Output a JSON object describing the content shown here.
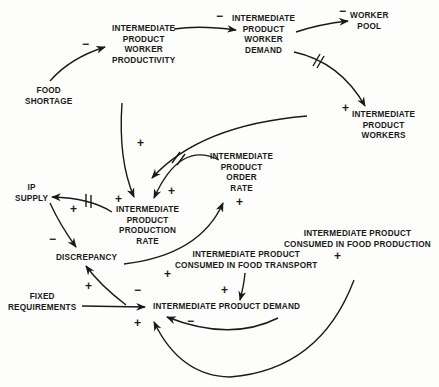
{
  "diagram": {
    "type": "causal-loop-diagram",
    "nodes": {
      "ip_worker_productivity": "INTERMEDIATE\nPRODUCT\nWORKER\nPRODUCTIVITY",
      "ip_worker_demand": "INTERMEDIATE\nPRODUCT\nWORKER\nDEMAND",
      "worker_pool": "WORKER\nPOOL",
      "food_shortage": "FOOD\nSHORTAGE",
      "ip_workers": "INTERMEDIATE\nPRODUCT\nWORKERS",
      "ip_order_rate": "INTERMEDIATE\nPRODUCT\nORDER\nRATE",
      "ip_supply": "IP\nSUPPLY",
      "ip_production_rate": "INTERMEDIATE\nPRODUCT\nPRODUCTION\nRATE",
      "discrepancy": "DISCREPANCY",
      "ip_consumed_food_production": "INTERMEDIATE PRODUCT\nCONSUMED IN FOOD PRODUCTION",
      "ip_consumed_food_transport": "INTERMEDIATE PRODUCT\nCONSUMED IN FOOD TRANSPORT",
      "fixed_requirements": "FIXED\nREQUIREMENTS",
      "ip_demand": "INTERMEDIATE PRODUCT DEMAND"
    },
    "links": [
      {
        "from": "FOOD SHORTAGE",
        "to": "INTERMEDIATE PRODUCT WORKER PRODUCTIVITY",
        "polarity": "-",
        "delay": false
      },
      {
        "from": "INTERMEDIATE PRODUCT WORKER PRODUCTIVITY",
        "to": "INTERMEDIATE PRODUCT WORKER DEMAND",
        "polarity": "-",
        "delay": false
      },
      {
        "from": "INTERMEDIATE PRODUCT WORKER DEMAND",
        "to": "WORKER POOL",
        "polarity": "-",
        "delay": false
      },
      {
        "from": "INTERMEDIATE PRODUCT WORKER DEMAND",
        "to": "INTERMEDIATE PRODUCT WORKERS",
        "polarity": "+",
        "delay": true
      },
      {
        "from": "INTERMEDIATE PRODUCT WORKER PRODUCTIVITY",
        "to": "INTERMEDIATE PRODUCT PRODUCTION RATE",
        "polarity": "+",
        "delay": false
      },
      {
        "from": "INTERMEDIATE PRODUCT WORKERS",
        "to": "INTERMEDIATE PRODUCT PRODUCTION RATE",
        "polarity": "+",
        "delay": false
      },
      {
        "from": "INTERMEDIATE PRODUCT ORDER RATE",
        "to": "INTERMEDIATE PRODUCT PRODUCTION RATE",
        "polarity": "+",
        "delay": true
      },
      {
        "from": "INTERMEDIATE PRODUCT PRODUCTION RATE",
        "to": "IP SUPPLY",
        "polarity": "+",
        "delay": true
      },
      {
        "from": "IP SUPPLY",
        "to": "DISCREPANCY",
        "polarity": "-",
        "delay": false
      },
      {
        "from": "DISCREPANCY",
        "to": "INTERMEDIATE PRODUCT ORDER RATE",
        "polarity": "+",
        "delay": false
      },
      {
        "from": "INTERMEDIATE PRODUCT DEMAND",
        "to": "DISCREPANCY",
        "polarity": "+",
        "delay": false
      },
      {
        "from": "FIXED REQUIREMENTS",
        "to": "INTERMEDIATE PRODUCT DEMAND",
        "polarity": "-",
        "delay": false
      },
      {
        "from": "INTERMEDIATE PRODUCT CONSUMED IN FOOD TRANSPORT",
        "to": "INTERMEDIATE PRODUCT DEMAND",
        "polarity": "+",
        "delay": false
      },
      {
        "from": "INTERMEDIATE PRODUCT CONSUMED IN FOOD TRANSPORT",
        "to": "INTERMEDIATE PRODUCT DEMAND",
        "polarity": "-",
        "delay": false
      },
      {
        "from": "INTERMEDIATE PRODUCT CONSUMED IN FOOD PRODUCTION",
        "to": "INTERMEDIATE PRODUCT DEMAND",
        "polarity": "+",
        "delay": false
      }
    ],
    "signs": {
      "s1": "−",
      "s2": "−",
      "s3": "−",
      "s4": "+",
      "s5": "+",
      "s6": "+",
      "s7": "+",
      "s8": "+",
      "s9": "+",
      "s10": "−",
      "s11": "+",
      "s12": "+",
      "s13": "+",
      "s14": "−",
      "s15": "+",
      "s16": "−",
      "s17": "+",
      "s18": "+"
    }
  }
}
